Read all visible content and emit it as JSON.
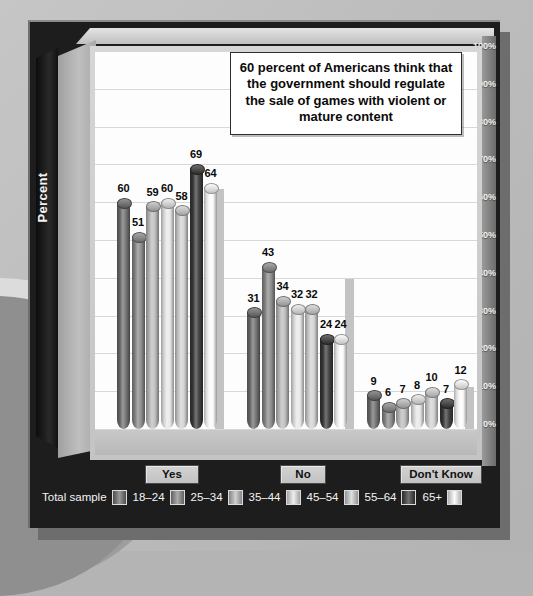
{
  "callout": {
    "text": "60 percent of Americans think that the government should regulate the sale of games with violent or mature content"
  },
  "axis": {
    "y_title": "Percent",
    "ticks": [
      "100%",
      "90%",
      "80%",
      "70%",
      "60%",
      "50%",
      "40%",
      "30%",
      "20%",
      "10%",
      "0%"
    ]
  },
  "legend": {
    "lead_label": "Total sample",
    "items": [
      {
        "label": "Total sample",
        "color": "#6e6e6e"
      },
      {
        "label": "18–24",
        "color": "#8a8a8a"
      },
      {
        "label": "25–34",
        "color": "#bdbdbd"
      },
      {
        "label": "35–44",
        "color": "#e8e8e8"
      },
      {
        "label": "45–54",
        "color": "#d2d2d2"
      },
      {
        "label": "55–64",
        "color": "#3a3a3a"
      },
      {
        "label": "65+",
        "color": "#fbfbfb"
      }
    ]
  },
  "group_labels": [
    "Yes",
    "No",
    "Don't Know"
  ],
  "chart_data": {
    "type": "bar",
    "title": "60 percent of Americans think that the government should regulate the sale of games with violent or mature content",
    "xlabel": "",
    "ylabel": "Percent",
    "ylim": [
      0,
      100
    ],
    "ytick_labels": [
      "0%",
      "10%",
      "20%",
      "30%",
      "40%",
      "50%",
      "60%",
      "70%",
      "80%",
      "90%",
      "100%"
    ],
    "grid": true,
    "legend_position": "bottom",
    "categories": [
      "Yes",
      "No",
      "Don't Know"
    ],
    "series": [
      {
        "name": "Total sample",
        "color": "#6e6e6e",
        "values": [
          60,
          31,
          9
        ]
      },
      {
        "name": "18–24",
        "color": "#8a8a8a",
        "values": [
          51,
          43,
          6
        ]
      },
      {
        "name": "25–34",
        "color": "#bdbdbd",
        "values": [
          59,
          34,
          7
        ]
      },
      {
        "name": "35–44",
        "color": "#e8e8e8",
        "values": [
          60,
          32,
          8
        ]
      },
      {
        "name": "45–54",
        "color": "#d2d2d2",
        "values": [
          58,
          32,
          10
        ]
      },
      {
        "name": "55–64",
        "color": "#3a3a3a",
        "values": [
          69,
          24,
          7
        ]
      },
      {
        "name": "65+",
        "color": "#fbfbfb",
        "values": [
          64,
          24,
          12
        ]
      }
    ]
  }
}
